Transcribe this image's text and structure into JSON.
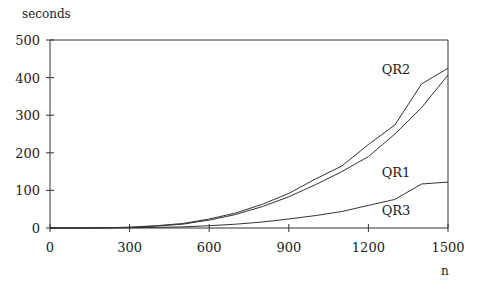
{
  "chart_data": {
    "type": "line",
    "title": "",
    "xlabel": "n",
    "ylabel": "seconds",
    "xlim": [
      0,
      1500
    ],
    "ylim": [
      0,
      500
    ],
    "x_ticks": [
      0,
      300,
      600,
      900,
      1200,
      1500
    ],
    "y_ticks": [
      0,
      100,
      200,
      300,
      400,
      500
    ],
    "grid": false,
    "legend": "inline labels",
    "x": [
      0,
      100,
      200,
      300,
      400,
      500,
      600,
      700,
      800,
      900,
      1000,
      1100,
      1200,
      1300,
      1400,
      1500
    ],
    "series": [
      {
        "name": "QR2",
        "values": [
          0,
          0,
          0.5,
          2,
          6,
          12,
          24,
          40,
          63,
          92,
          130,
          165,
          222,
          274,
          383,
          425
        ],
        "label_pos": [
          1250,
          410
        ]
      },
      {
        "name": "QR1",
        "values": [
          0,
          0,
          0.5,
          1.5,
          5,
          10,
          21,
          36,
          57,
          83,
          115,
          150,
          190,
          250,
          320,
          407
        ],
        "label_pos": [
          1250,
          135
        ]
      },
      {
        "name": "QR3",
        "values": [
          0,
          0,
          0,
          0.5,
          1.5,
          3,
          6,
          10,
          16,
          24,
          33,
          44,
          60,
          76,
          117,
          122
        ],
        "label_pos": [
          1250,
          35
        ]
      }
    ]
  }
}
